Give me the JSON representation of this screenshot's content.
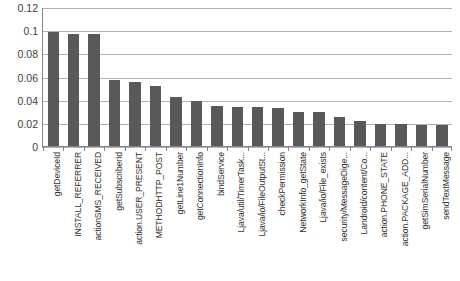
{
  "chart_data": {
    "type": "bar",
    "title": "",
    "subtitle": "",
    "xlabel": "",
    "ylabel": "",
    "ylim": [
      0,
      0.12
    ],
    "ytick_labels": [
      "0.12",
      "0.1",
      "0.08",
      "0.06",
      "0.04",
      "0.02",
      "0"
    ],
    "ytick_values": [
      0.12,
      0.1,
      0.08,
      0.06,
      0.04,
      0.02,
      0
    ],
    "grid": true,
    "legend": null,
    "legend_position": "none",
    "bar_color": "#595959",
    "gridline_color": "#b3b3b3",
    "axis_color": "#868686",
    "categories": [
      "getDeviceId",
      "INSTALL_REFERRER",
      "actionSMS_RECEIVED",
      "getSubscriberId",
      "action.USER_PRESENT",
      "METHODHTTP_POST",
      "getLine1Number",
      "getConnectionInfo",
      "bindService",
      "Ljava/util/TimerTask...",
      "Ljava/io/FileOutputSt...",
      "checkPermission",
      "NetworkInfo_getState",
      "Ljava/io/File_exists",
      "security/MessageDige...",
      "Landroid/content/Co...",
      "action.PHONE_STATE",
      "action.PACKAGE_ADD...",
      "getSimSerialNumber",
      "sendTextMessage"
    ],
    "values": [
      0.099,
      0.097,
      0.097,
      0.057,
      0.056,
      0.052,
      0.043,
      0.039,
      0.035,
      0.034,
      0.034,
      0.033,
      0.03,
      0.03,
      0.025,
      0.022,
      0.019,
      0.019,
      0.018,
      0.018
    ]
  }
}
